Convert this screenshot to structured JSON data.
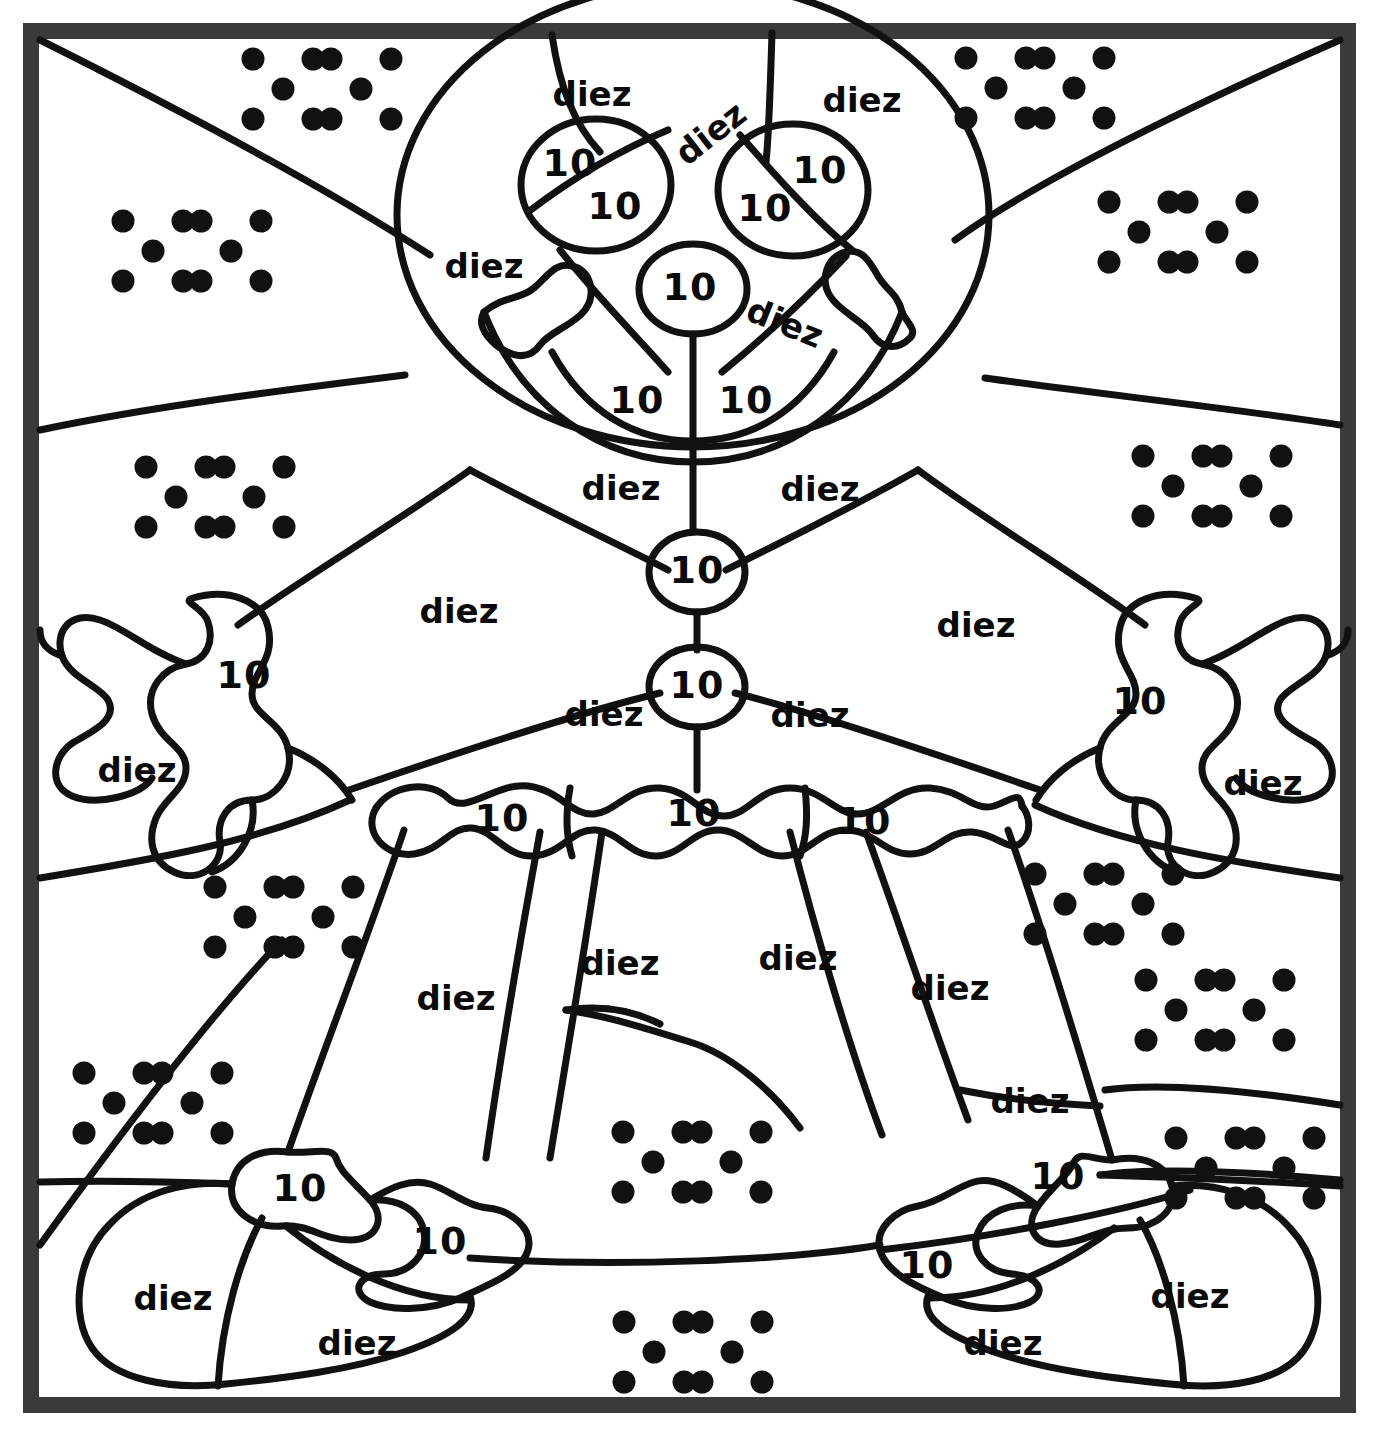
{
  "worksheet": {
    "title": "Color by number - diez / 10",
    "language": "es",
    "word_label": "diez",
    "number_label": "10",
    "frame_color": "#3a3a3a",
    "line_color": "#111111",
    "background_color": "#ffffff",
    "dot_color": "#111111",
    "dots_per_group": 5,
    "groups_per_cluster": 2,
    "dots_per_cluster_total": 10
  },
  "word_labels": [
    {
      "id": "w01",
      "text": "diez",
      "x": 592,
      "y": 96,
      "rotate": 0
    },
    {
      "id": "w02",
      "text": "diez",
      "x": 712,
      "y": 135,
      "rotate": -38
    },
    {
      "id": "w03",
      "text": "diez",
      "x": 862,
      "y": 102,
      "rotate": 0
    },
    {
      "id": "w04",
      "text": "diez",
      "x": 484,
      "y": 268,
      "rotate": 0
    },
    {
      "id": "w05",
      "text": "diez",
      "x": 784,
      "y": 325,
      "rotate": 22
    },
    {
      "id": "w06",
      "text": "diez",
      "x": 621,
      "y": 490,
      "rotate": 0
    },
    {
      "id": "w07",
      "text": "diez",
      "x": 820,
      "y": 491,
      "rotate": 0
    },
    {
      "id": "w08",
      "text": "diez",
      "x": 459,
      "y": 613,
      "rotate": 0
    },
    {
      "id": "w09",
      "text": "diez",
      "x": 976,
      "y": 627,
      "rotate": 0
    },
    {
      "id": "w10",
      "text": "diez",
      "x": 137,
      "y": 772,
      "rotate": 0
    },
    {
      "id": "w11",
      "text": "diez",
      "x": 1263,
      "y": 785,
      "rotate": 0
    },
    {
      "id": "w12",
      "text": "diez",
      "x": 604,
      "y": 716,
      "rotate": 0
    },
    {
      "id": "w13",
      "text": "diez",
      "x": 810,
      "y": 717,
      "rotate": 0
    },
    {
      "id": "w14",
      "text": "diez",
      "x": 456,
      "y": 1000,
      "rotate": 0
    },
    {
      "id": "w15",
      "text": "diez",
      "x": 620,
      "y": 965,
      "rotate": 0
    },
    {
      "id": "w16",
      "text": "diez",
      "x": 798,
      "y": 960,
      "rotate": 0
    },
    {
      "id": "w17",
      "text": "diez",
      "x": 950,
      "y": 990,
      "rotate": 0
    },
    {
      "id": "w18",
      "text": "diez",
      "x": 1030,
      "y": 1103,
      "rotate": 0
    },
    {
      "id": "w19",
      "text": "diez",
      "x": 173,
      "y": 1300,
      "rotate": 0
    },
    {
      "id": "w20",
      "text": "diez",
      "x": 357,
      "y": 1345,
      "rotate": 0
    },
    {
      "id": "w21",
      "text": "diez",
      "x": 1003,
      "y": 1345,
      "rotate": 0
    },
    {
      "id": "w22",
      "text": "diez",
      "x": 1190,
      "y": 1298,
      "rotate": 0
    }
  ],
  "number_labels": [
    {
      "id": "n01",
      "text": "10",
      "x": 570,
      "y": 165
    },
    {
      "id": "n02",
      "text": "10",
      "x": 615,
      "y": 208
    },
    {
      "id": "n03",
      "text": "10",
      "x": 820,
      "y": 172
    },
    {
      "id": "n04",
      "text": "10",
      "x": 765,
      "y": 210
    },
    {
      "id": "n05",
      "text": "10",
      "x": 690,
      "y": 289
    },
    {
      "id": "n06",
      "text": "10",
      "x": 637,
      "y": 402
    },
    {
      "id": "n07",
      "text": "10",
      "x": 746,
      "y": 402
    },
    {
      "id": "n08",
      "text": "10",
      "x": 697,
      "y": 572
    },
    {
      "id": "n09",
      "text": "10",
      "x": 697,
      "y": 687
    },
    {
      "id": "n10",
      "text": "10",
      "x": 244,
      "y": 677
    },
    {
      "id": "n11",
      "text": "10",
      "x": 1140,
      "y": 703
    },
    {
      "id": "n12",
      "text": "10",
      "x": 502,
      "y": 820
    },
    {
      "id": "n13",
      "text": "10",
      "x": 694,
      "y": 815
    },
    {
      "id": "n14",
      "text": "10",
      "x": 864,
      "y": 823
    },
    {
      "id": "n15",
      "text": "10",
      "x": 300,
      "y": 1190
    },
    {
      "id": "n16",
      "text": "10",
      "x": 440,
      "y": 1243
    },
    {
      "id": "n17",
      "text": "10",
      "x": 1058,
      "y": 1178
    },
    {
      "id": "n18",
      "text": "10",
      "x": 927,
      "y": 1267
    }
  ],
  "dot_clusters": [
    {
      "id": "d01",
      "cx": 322,
      "cy": 89
    },
    {
      "id": "d02",
      "cx": 1035,
      "cy": 88
    },
    {
      "id": "d03",
      "cx": 192,
      "cy": 251
    },
    {
      "id": "d04",
      "cx": 1178,
      "cy": 232
    },
    {
      "id": "d05",
      "cx": 215,
      "cy": 497
    },
    {
      "id": "d06",
      "cx": 1212,
      "cy": 486
    },
    {
      "id": "d07",
      "cx": 284,
      "cy": 917
    },
    {
      "id": "d08",
      "cx": 1104,
      "cy": 904
    },
    {
      "id": "d09",
      "cx": 1215,
      "cy": 1010
    },
    {
      "id": "d10",
      "cx": 153,
      "cy": 1103
    },
    {
      "id": "d11",
      "cx": 692,
      "cy": 1162
    },
    {
      "id": "d12",
      "cx": 1245,
      "cy": 1168
    },
    {
      "id": "d13",
      "cx": 693,
      "cy": 1352
    }
  ],
  "chart_data": {
    "type": "table",
    "categories": [
      "diez",
      "10",
      "dice-dots"
    ],
    "values": [
      22,
      18,
      13
    ]
  }
}
